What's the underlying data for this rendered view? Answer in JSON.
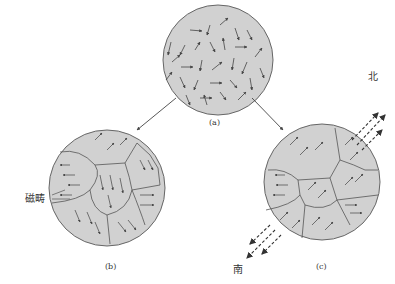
{
  "figure": {
    "panels": [
      {
        "id": "a",
        "label": "(a)",
        "description": "Randomly oriented magnetic domains"
      },
      {
        "id": "b",
        "label": "(b)",
        "description": "Domains with boundaries, unmagnetized"
      },
      {
        "id": "c",
        "label": "(c)",
        "description": "Domains aligned, magnetized"
      }
    ],
    "annotations": {
      "domain_label": "磁畴",
      "north_label": "北",
      "south_label": "南"
    },
    "colors": {
      "circle_fill": "#d4d4d4",
      "stroke": "#555555",
      "arrow": "#444444"
    }
  }
}
